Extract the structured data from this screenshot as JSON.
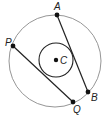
{
  "diagram": {
    "type": "geometry-circles",
    "colors": {
      "outer_circle": "#8a8a8a",
      "inner_circle": "#222222",
      "chord": "#222222",
      "point": "#111111",
      "label": "#222222",
      "background": "#ffffff"
    },
    "outer_circle": {
      "cx": 55,
      "cy": 61,
      "r": 46
    },
    "inner_circle": {
      "cx": 56,
      "cy": 60,
      "r": 17
    },
    "center": {
      "name": "C",
      "x": 56,
      "y": 60,
      "label": "C",
      "label_x": 60,
      "label_y": 64
    },
    "points": [
      {
        "name": "A",
        "x": 57,
        "y": 15,
        "label": "A",
        "label_x": 54,
        "label_y": 10
      },
      {
        "name": "B",
        "x": 88,
        "y": 92,
        "label": "B",
        "label_x": 91,
        "label_y": 101
      },
      {
        "name": "P",
        "x": 13,
        "y": 46,
        "label": "P",
        "label_x": 5,
        "label_y": 46
      },
      {
        "name": "Q",
        "x": 73,
        "y": 102,
        "label": "Q",
        "label_x": 73,
        "label_y": 113
      }
    ],
    "segments": [
      {
        "name": "AB",
        "from": "A",
        "to": "B"
      },
      {
        "name": "PQ",
        "from": "P",
        "to": "Q"
      }
    ]
  }
}
